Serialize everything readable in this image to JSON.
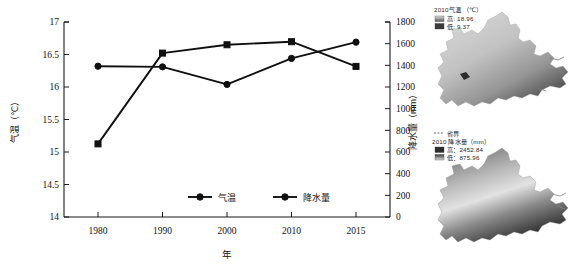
{
  "chart_data": {
    "type": "line",
    "title": "",
    "xlabel": "年",
    "categories": [
      "1980",
      "1990",
      "2000",
      "2010",
      "2015"
    ],
    "x_tick_labels": [
      "1980",
      "1990",
      "2000",
      "2010",
      "2015"
    ],
    "grid": false,
    "legend_position": "bottom-center",
    "axes": {
      "left": {
        "label": "气温（℃）",
        "unit": "℃",
        "ylim": [
          14,
          17
        ],
        "ticks": [
          "14",
          "14.5",
          "15",
          "15.5",
          "16",
          "16.5",
          "17"
        ],
        "tick_values": [
          14,
          14.5,
          15,
          15.5,
          16,
          16.5,
          17
        ]
      },
      "right": {
        "label": "降水量（mm）",
        "unit": "mm",
        "ylim": [
          0,
          1800
        ],
        "ticks": [
          "0",
          "200",
          "400",
          "600",
          "800",
          "1000",
          "1200",
          "1400",
          "1600",
          "1800"
        ],
        "tick_values": [
          0,
          200,
          400,
          600,
          800,
          1000,
          1200,
          1400,
          1600,
          1800
        ]
      }
    },
    "series": [
      {
        "name": "气温",
        "axis": "left",
        "marker": "circle",
        "values": [
          16.32,
          16.31,
          16.04,
          16.44,
          16.69
        ]
      },
      {
        "name": "降水量",
        "axis": "right",
        "marker": "square",
        "values": [
          675,
          1513,
          1590,
          1618,
          1390
        ]
      }
    ],
    "legend": [
      "气温",
      "降水量"
    ]
  },
  "maps": {
    "temperature_map": {
      "title": "2010气温 （℃）",
      "high_label": "高: 18.96",
      "low_label": "低: 9.37",
      "high_value": 18.96,
      "low_value": 9.37,
      "name": "chongqing-temperature-map"
    },
    "precipitation_map": {
      "boundary_label": "省界",
      "title": "2010 降水量（mm）",
      "high_label": "高：2452.84",
      "low_label": "低：875.96",
      "high_value": 2452.84,
      "low_value": 875.96,
      "name": "chongqing-precipitation-map"
    }
  },
  "colors": {
    "line": "#101010",
    "axis": "#1a1a1a",
    "text": "#111111",
    "map_high": "#d9d9d9",
    "map_low": "#2b2b2b"
  }
}
